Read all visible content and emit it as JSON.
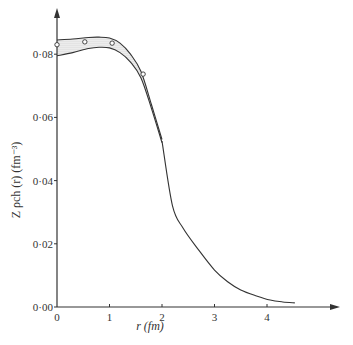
{
  "chart_data": {
    "type": "line",
    "title": "",
    "xlabel": "r (fm)",
    "ylabel": "Z ρch (r) (fm⁻³)",
    "xlim": [
      0,
      5
    ],
    "ylim": [
      0,
      0.087
    ],
    "x_ticks": [
      0,
      1,
      2,
      3,
      4
    ],
    "x_tick_labels": [
      "0",
      "1",
      "2",
      "3",
      "4"
    ],
    "y_ticks": [
      0.0,
      0.02,
      0.04,
      0.06,
      0.08
    ],
    "y_tick_labels": [
      "0·00",
      "0·02",
      "0·04",
      "0·06",
      "0·08"
    ],
    "grid": false,
    "series": [
      {
        "name": "error band upper",
        "x": [
          0,
          0.3,
          0.6,
          0.8,
          1.0,
          1.2,
          1.4,
          1.6,
          1.8,
          2.0
        ],
        "y": [
          0.0845,
          0.0848,
          0.0853,
          0.0854,
          0.0851,
          0.0835,
          0.08,
          0.0745,
          0.064,
          0.053
        ]
      },
      {
        "name": "error band lower",
        "x": [
          0,
          0.3,
          0.6,
          0.8,
          1.0,
          1.2,
          1.4,
          1.6,
          1.8,
          2.0
        ],
        "y": [
          0.0795,
          0.0805,
          0.0818,
          0.0822,
          0.082,
          0.0805,
          0.0775,
          0.0725,
          0.0628,
          0.052
        ]
      },
      {
        "name": "charge density",
        "x": [
          2.0,
          2.2,
          2.4,
          2.7,
          3.0,
          3.25,
          3.5,
          3.8,
          4.06,
          4.3,
          4.53
        ],
        "y": [
          0.0525,
          0.032,
          0.025,
          0.018,
          0.0117,
          0.008,
          0.0054,
          0.0035,
          0.0022,
          0.0016,
          0.0013
        ]
      },
      {
        "name": "experimental points",
        "x": [
          0.0,
          0.53,
          1.05,
          1.64
        ],
        "y": [
          0.083,
          0.0839,
          0.0835,
          0.0737
        ]
      }
    ]
  }
}
